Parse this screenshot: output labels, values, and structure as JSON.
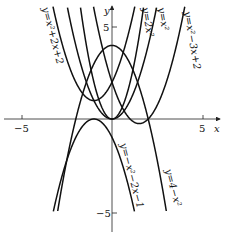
{
  "chart_data": {
    "type": "line",
    "title": "",
    "xlabel": "x",
    "ylabel": "y",
    "xlim": [
      -5.8,
      6.2
    ],
    "ylim": [
      -6.2,
      6.5
    ],
    "x_ticks": [
      {
        "value": -5,
        "label": "-5"
      },
      {
        "value": 5,
        "label": "5"
      }
    ],
    "y_ticks": [
      {
        "value": 5,
        "label": "5"
      },
      {
        "value": -5,
        "label": "-5"
      }
    ],
    "grid": false,
    "series": [
      {
        "name": "y=x^2+2x+2",
        "label": "y=x²+2x+2",
        "a": 1,
        "b": 2,
        "c": 2
      },
      {
        "name": "y=2x^2",
        "label": "y=2x²",
        "a": 2,
        "b": 0,
        "c": 0
      },
      {
        "name": "y=x^2",
        "label": "y=x²",
        "a": 1,
        "b": 0,
        "c": 0
      },
      {
        "name": "y=x^2-3x+2",
        "label": "y=x²−3x+2",
        "a": 1,
        "b": -3,
        "c": 2
      },
      {
        "name": "y=-x^2-2x-1",
        "label": "y=−x²−2x−1",
        "a": -1,
        "b": -2,
        "c": -1
      },
      {
        "name": "y=4-x^2",
        "label": "y=4−x²",
        "a": -1,
        "b": 0,
        "c": 4
      }
    ]
  },
  "axes": {
    "x_label": "x",
    "y_label": "y",
    "x_tick_neg": "−5",
    "x_tick_pos": "5",
    "y_tick_pos": "5",
    "y_tick_neg": "−5"
  },
  "labels": {
    "c1": "y=x²+2x+2",
    "c2": "y=2x²",
    "c3": "y=x²",
    "c4": "y=x²−3x+2",
    "c5": "y=−x²−2x−1",
    "c6": "y=4−x²"
  }
}
